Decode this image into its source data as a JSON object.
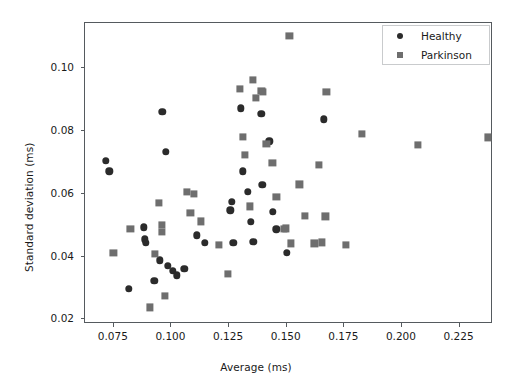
{
  "chart_data": {
    "type": "scatter",
    "title": "",
    "xlabel": "Average (ms)",
    "ylabel": "Standard deviation (ms)",
    "xlim": [
      0.0625,
      0.2395
    ],
    "ylim": [
      0.0185,
      0.1145
    ],
    "xticks": [
      0.075,
      0.1,
      0.125,
      0.15,
      0.175,
      0.2,
      0.225
    ],
    "xticklabels": [
      "0.075",
      "0.100",
      "0.125",
      "0.150",
      "0.175",
      "0.200",
      "0.225"
    ],
    "yticks": [
      0.02,
      0.04,
      0.06,
      0.08,
      0.1
    ],
    "yticklabels": [
      "0.02",
      "0.04",
      "0.06",
      "0.08",
      "0.10"
    ],
    "grid": false,
    "legend_position": "upper right",
    "series": [
      {
        "name": "Healthy",
        "marker": "circle",
        "color": "#2b2b2b",
        "points": [
          [
            0.0715,
            0.0705
          ],
          [
            0.073,
            0.0672
          ],
          [
            0.0815,
            0.0297
          ],
          [
            0.088,
            0.0493
          ],
          [
            0.0885,
            0.0455
          ],
          [
            0.0888,
            0.0443
          ],
          [
            0.0925,
            0.0322
          ],
          [
            0.095,
            0.0388
          ],
          [
            0.096,
            0.0862
          ],
          [
            0.0975,
            0.0735
          ],
          [
            0.0985,
            0.037
          ],
          [
            0.1005,
            0.0355
          ],
          [
            0.1022,
            0.034
          ],
          [
            0.1055,
            0.0362
          ],
          [
            0.111,
            0.0468
          ],
          [
            0.1145,
            0.0443
          ],
          [
            0.1255,
            0.0548
          ],
          [
            0.1262,
            0.0575
          ],
          [
            0.1268,
            0.0443
          ],
          [
            0.13,
            0.0873
          ],
          [
            0.131,
            0.0672
          ],
          [
            0.133,
            0.0607
          ],
          [
            0.1345,
            0.051
          ],
          [
            0.1355,
            0.0448
          ],
          [
            0.139,
            0.0855
          ],
          [
            0.1395,
            0.0628
          ],
          [
            0.1425,
            0.0768
          ],
          [
            0.144,
            0.0542
          ],
          [
            0.1455,
            0.0487
          ],
          [
            0.15,
            0.0412
          ],
          [
            0.166,
            0.0838
          ]
        ]
      },
      {
        "name": "Parkinson",
        "marker": "square",
        "color": "#6e6e6e",
        "points": [
          [
            0.0748,
            0.0412
          ],
          [
            0.0822,
            0.0487
          ],
          [
            0.0905,
            0.0238
          ],
          [
            0.0928,
            0.0408
          ],
          [
            0.0945,
            0.0572
          ],
          [
            0.0958,
            0.05
          ],
          [
            0.096,
            0.0478
          ],
          [
            0.0972,
            0.0275
          ],
          [
            0.1068,
            0.0607
          ],
          [
            0.1082,
            0.054
          ],
          [
            0.1098,
            0.06
          ],
          [
            0.1128,
            0.0512
          ],
          [
            0.1205,
            0.0438
          ],
          [
            0.1245,
            0.0345
          ],
          [
            0.1298,
            0.0935
          ],
          [
            0.131,
            0.0782
          ],
          [
            0.1318,
            0.0725
          ],
          [
            0.1342,
            0.056
          ],
          [
            0.1355,
            0.0963
          ],
          [
            0.1368,
            0.0905
          ],
          [
            0.139,
            0.0928
          ],
          [
            0.1398,
            0.0925
          ],
          [
            0.1412,
            0.076
          ],
          [
            0.1438,
            0.0698
          ],
          [
            0.1455,
            0.059
          ],
          [
            0.1488,
            0.0487
          ],
          [
            0.1495,
            0.049
          ],
          [
            0.1512,
            0.1105
          ],
          [
            0.152,
            0.0442
          ],
          [
            0.1555,
            0.063
          ],
          [
            0.158,
            0.053
          ],
          [
            0.162,
            0.0442
          ],
          [
            0.164,
            0.0692
          ],
          [
            0.1652,
            0.0445
          ],
          [
            0.1668,
            0.0528
          ],
          [
            0.1672,
            0.0925
          ],
          [
            0.1758,
            0.0437
          ],
          [
            0.1828,
            0.079
          ],
          [
            0.2068,
            0.0757
          ],
          [
            0.2372,
            0.078
          ]
        ]
      }
    ]
  }
}
